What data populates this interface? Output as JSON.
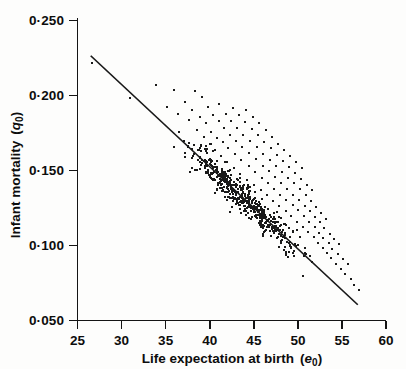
{
  "chart_data": {
    "type": "scatter",
    "title": "",
    "xlabel": "Life expectation at birth (e0)",
    "xlabel_main": "Life expectation at birth",
    "xlabel_symbol": "e",
    "xlabel_symbol_sub": "0",
    "ylabel": "Infant mortality (q0)",
    "ylabel_main": "Infant mortality",
    "ylabel_symbol": "q",
    "ylabel_symbol_sub": "0",
    "xlim": [
      25,
      60
    ],
    "ylim": [
      0.05,
      0.25
    ],
    "xticks": [
      25,
      30,
      35,
      40,
      45,
      50,
      55,
      60
    ],
    "xtick_labels": [
      "25",
      "30",
      "35",
      "40",
      "45",
      "50",
      "55",
      "60"
    ],
    "yticks": [
      0.05,
      0.1,
      0.15,
      0.2,
      0.25
    ],
    "ytick_labels": [
      "0·050",
      "0·100",
      "0·150",
      "0·200",
      "0·250"
    ],
    "grid": false,
    "legend": "none",
    "fit_line": {
      "name": "regression line",
      "x_start": 26.5,
      "y_start": 0.2265,
      "x_end": 56.8,
      "y_end": 0.0605
    },
    "series": [
      {
        "name": "countries",
        "marker": "square",
        "marker_size_px": 2,
        "color": "#1a1a1a",
        "n_points": 640,
        "points": [
          [
            26.6,
            0.2215
          ],
          [
            31.0,
            0.1985
          ],
          [
            33.9,
            0.207
          ],
          [
            35.1,
            0.1925
          ],
          [
            35.9,
            0.204
          ],
          [
            36.4,
            0.188
          ],
          [
            37.2,
            0.1955
          ],
          [
            37.6,
            0.1835
          ],
          [
            38.0,
            0.1905
          ],
          [
            38.3,
            0.203
          ],
          [
            38.6,
            0.177
          ],
          [
            38.9,
            0.186
          ],
          [
            39.1,
            0.199
          ],
          [
            39.4,
            0.1725
          ],
          [
            39.6,
            0.1815
          ],
          [
            39.8,
            0.1925
          ],
          [
            40.0,
            0.168
          ],
          [
            40.2,
            0.176
          ],
          [
            40.4,
            0.187
          ],
          [
            40.6,
            0.164
          ],
          [
            40.8,
            0.1715
          ],
          [
            41.0,
            0.183
          ],
          [
            41.1,
            0.1945
          ],
          [
            41.3,
            0.16
          ],
          [
            41.5,
            0.169
          ],
          [
            41.6,
            0.1785
          ],
          [
            41.8,
            0.188
          ],
          [
            42.0,
            0.1555
          ],
          [
            42.1,
            0.165
          ],
          [
            42.3,
            0.174
          ],
          [
            42.4,
            0.183
          ],
          [
            42.6,
            0.192
          ],
          [
            42.7,
            0.152
          ],
          [
            42.9,
            0.161
          ],
          [
            43.0,
            0.17
          ],
          [
            43.1,
            0.1785
          ],
          [
            43.3,
            0.187
          ],
          [
            43.4,
            0.148
          ],
          [
            43.6,
            0.157
          ],
          [
            43.7,
            0.1655
          ],
          [
            43.8,
            0.174
          ],
          [
            44.0,
            0.1825
          ],
          [
            44.1,
            0.1905
          ],
          [
            44.2,
            0.144
          ],
          [
            44.4,
            0.153
          ],
          [
            44.5,
            0.1615
          ],
          [
            44.6,
            0.17
          ],
          [
            44.8,
            0.178
          ],
          [
            44.9,
            0.186
          ],
          [
            45.0,
            0.1405
          ],
          [
            45.1,
            0.149
          ],
          [
            45.3,
            0.1575
          ],
          [
            45.4,
            0.1655
          ],
          [
            45.5,
            0.1735
          ],
          [
            45.6,
            0.1815
          ],
          [
            45.8,
            0.137
          ],
          [
            45.9,
            0.145
          ],
          [
            46.0,
            0.153
          ],
          [
            46.1,
            0.161
          ],
          [
            46.2,
            0.169
          ],
          [
            46.4,
            0.177
          ],
          [
            46.5,
            0.1335
          ],
          [
            46.6,
            0.1415
          ],
          [
            46.7,
            0.1495
          ],
          [
            46.8,
            0.157
          ],
          [
            47.0,
            0.165
          ],
          [
            47.1,
            0.1725
          ],
          [
            47.2,
            0.13
          ],
          [
            47.3,
            0.138
          ],
          [
            47.4,
            0.1455
          ],
          [
            47.5,
            0.153
          ],
          [
            47.6,
            0.1605
          ],
          [
            47.8,
            0.168
          ],
          [
            47.9,
            0.1265
          ],
          [
            48.0,
            0.134
          ],
          [
            48.1,
            0.1415
          ],
          [
            48.2,
            0.149
          ],
          [
            48.3,
            0.1565
          ],
          [
            48.4,
            0.164
          ],
          [
            48.6,
            0.123
          ],
          [
            48.7,
            0.1305
          ],
          [
            48.8,
            0.138
          ],
          [
            48.9,
            0.145
          ],
          [
            49.0,
            0.1525
          ],
          [
            49.1,
            0.16
          ],
          [
            49.2,
            0.1195
          ],
          [
            49.4,
            0.127
          ],
          [
            49.5,
            0.134
          ],
          [
            49.6,
            0.1415
          ],
          [
            49.7,
            0.1485
          ],
          [
            49.8,
            0.156
          ],
          [
            49.9,
            0.116
          ],
          [
            50.0,
            0.1235
          ],
          [
            50.1,
            0.1305
          ],
          [
            50.2,
            0.1375
          ],
          [
            50.4,
            0.1445
          ],
          [
            50.5,
            0.1515
          ],
          [
            50.6,
            0.1125
          ],
          [
            50.7,
            0.1195
          ],
          [
            50.8,
            0.1265
          ],
          [
            50.9,
            0.1335
          ],
          [
            51.0,
            0.1405
          ],
          [
            51.2,
            0.109
          ],
          [
            51.3,
            0.116
          ],
          [
            51.4,
            0.123
          ],
          [
            51.5,
            0.13
          ],
          [
            51.6,
            0.137
          ],
          [
            51.8,
            0.1055
          ],
          [
            51.9,
            0.1125
          ],
          [
            52.0,
            0.119
          ],
          [
            52.1,
            0.126
          ],
          [
            52.3,
            0.102
          ],
          [
            52.4,
            0.1085
          ],
          [
            52.5,
            0.1155
          ],
          [
            52.6,
            0.122
          ],
          [
            52.8,
            0.0985
          ],
          [
            52.9,
            0.105
          ],
          [
            53.0,
            0.1115
          ],
          [
            53.2,
            0.118
          ],
          [
            53.3,
            0.095
          ],
          [
            53.5,
            0.1015
          ],
          [
            53.6,
            0.108
          ],
          [
            53.8,
            0.0915
          ],
          [
            53.9,
            0.098
          ],
          [
            54.1,
            0.1045
          ],
          [
            54.3,
            0.088
          ],
          [
            54.5,
            0.0945
          ],
          [
            54.7,
            0.101
          ],
          [
            54.9,
            0.0845
          ],
          [
            55.1,
            0.091
          ],
          [
            55.4,
            0.081
          ],
          [
            55.7,
            0.0875
          ],
          [
            56.0,
            0.0775
          ],
          [
            56.4,
            0.074
          ],
          [
            56.9,
            0.0705
          ]
        ]
      }
    ]
  },
  "plot": {
    "axis_color": "#141414",
    "point_color": "#1a1a1a",
    "line_color": "#181818",
    "background": "#fdfdfc"
  }
}
